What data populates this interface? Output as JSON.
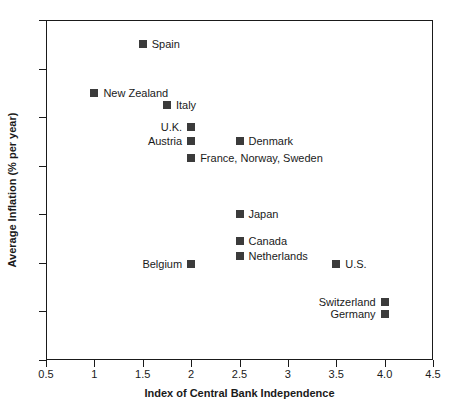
{
  "chart_data": {
    "type": "scatter",
    "title": "",
    "xlabel": "Index of Central Bank Independence",
    "ylabel": "Average Inflation (% per year)",
    "xlim": [
      0.5,
      4.5
    ],
    "ylim": [
      2,
      9
    ],
    "grid": false,
    "legend": "none",
    "xticks": [
      "0.5",
      "1",
      "1.5",
      "2",
      "2.5",
      "3",
      "3.5",
      "4.0",
      "4.5"
    ],
    "xtick_values": [
      0.5,
      1,
      1.5,
      2,
      2.5,
      3,
      3.5,
      4.0,
      4.5
    ],
    "yticks": [
      "2",
      "3",
      "4",
      "5",
      "6",
      "7",
      "8",
      "9"
    ],
    "ytick_values": [
      2,
      3,
      4,
      5,
      6,
      7,
      8,
      9
    ],
    "marker_color": "#3b3b3b",
    "points": [
      {
        "label": "Spain",
        "x": 1.5,
        "y": 8.5,
        "label_side": "right"
      },
      {
        "label": "New Zealand",
        "x": 1.0,
        "y": 7.5,
        "label_side": "right"
      },
      {
        "label": "Italy",
        "x": 1.75,
        "y": 7.25,
        "label_side": "right"
      },
      {
        "label": "U.K.",
        "x": 2.0,
        "y": 6.8,
        "label_side": "left"
      },
      {
        "label": "Austria",
        "x": 2.0,
        "y": 6.5,
        "label_side": "left"
      },
      {
        "label": "Denmark",
        "x": 2.5,
        "y": 6.5,
        "label_side": "right"
      },
      {
        "label": "France, Norway, Sweden",
        "x": 2.0,
        "y": 6.15,
        "label_side": "right"
      },
      {
        "label": "Japan",
        "x": 2.5,
        "y": 5.0,
        "label_side": "right"
      },
      {
        "label": "Canada",
        "x": 2.5,
        "y": 4.45,
        "label_side": "right"
      },
      {
        "label": "Netherlands",
        "x": 2.5,
        "y": 4.15,
        "label_side": "right"
      },
      {
        "label": "Belgium",
        "x": 2.0,
        "y": 3.97,
        "label_side": "left"
      },
      {
        "label": "U.S.",
        "x": 3.5,
        "y": 3.97,
        "label_side": "right"
      },
      {
        "label": "Switzerland",
        "x": 4.0,
        "y": 3.2,
        "label_side": "left"
      },
      {
        "label": "Germany",
        "x": 4.0,
        "y": 2.95,
        "label_side": "left"
      }
    ]
  }
}
